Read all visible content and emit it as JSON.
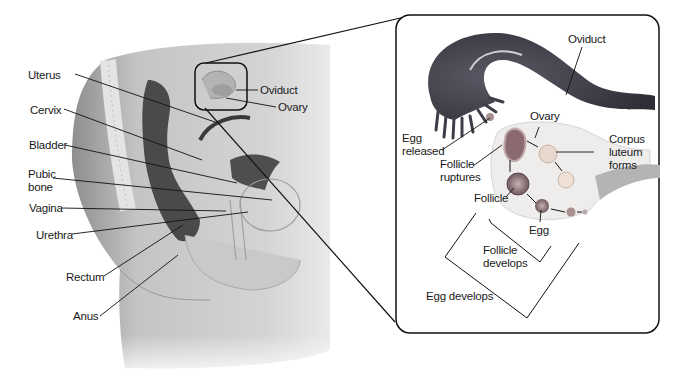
{
  "figure": {
    "left_panel": {
      "title": "Female reproductive system (side view)",
      "labels": {
        "uterus": "Uterus",
        "cervix": "Cervix",
        "bladder": "Bladder",
        "pubic_bone": "Pubic\nbone",
        "vagina": "Vagina",
        "urethra": "Urethra",
        "rectum": "Rectum",
        "anus": "Anus",
        "oviduct": "Oviduct",
        "ovary": "Ovary"
      }
    },
    "inset_panel": {
      "labels": {
        "oviduct": "Oviduct",
        "ovary": "Ovary",
        "egg_released": "Egg\nreleased",
        "follicle_ruptures": "Follicle\nruptures",
        "corpus_luteum_forms": "Corpus\nluteum\nforms",
        "follicle": "Follicle",
        "egg": "Egg",
        "follicle_develops": "Follicle\ndevelops",
        "egg_develops": "Egg develops"
      }
    },
    "colors": {
      "line": "#111111",
      "oviduct_dark": "#3a3a44",
      "ovary_fill": "#ecebea",
      "body_gray": "#b8b8b8",
      "follicle": "#8a6a70",
      "corpus_luteum": "#e6d7cc"
    }
  }
}
